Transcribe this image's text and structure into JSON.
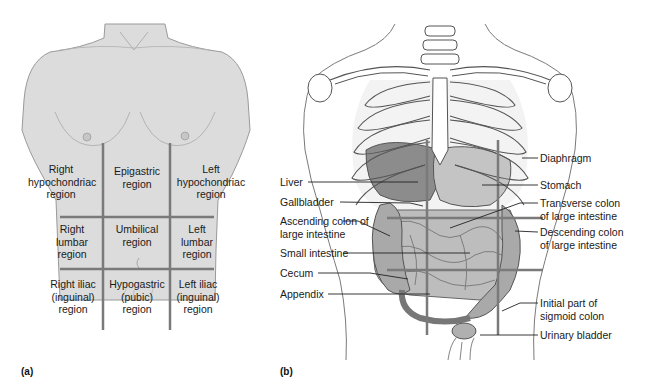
{
  "figure": {
    "panel_a": {
      "letter": "(a)",
      "regions": [
        {
          "id": "right-hypochondriac",
          "label": "Right\nhypochondriac\nregion"
        },
        {
          "id": "epigastric",
          "label": "Epigastric\nregion"
        },
        {
          "id": "left-hypochondriac",
          "label": "Left\nhypochondriac\nregion"
        },
        {
          "id": "right-lumbar",
          "label": "Right\nlumbar\nregion"
        },
        {
          "id": "umbilical",
          "label": "Umbilical\nregion"
        },
        {
          "id": "left-lumbar",
          "label": "Left\nlumbar\nregion"
        },
        {
          "id": "right-iliac",
          "label": "Right iliac\n(inguinal)\nregion"
        },
        {
          "id": "hypogastric",
          "label": "Hypogastric\n(pubic)\nregion"
        },
        {
          "id": "left-iliac",
          "label": "Left iliac\n(inguinal)\nregion"
        }
      ]
    },
    "panel_b": {
      "letter": "(b)",
      "left_labels": [
        {
          "id": "liver",
          "label": "Liver"
        },
        {
          "id": "gallbladder",
          "label": "Gallbladder"
        },
        {
          "id": "ascending-colon",
          "label": "Ascending colon of\nlarge intestine"
        },
        {
          "id": "small-intestine",
          "label": "Small intestine"
        },
        {
          "id": "cecum",
          "label": "Cecum"
        },
        {
          "id": "appendix",
          "label": "Appendix"
        }
      ],
      "right_labels": [
        {
          "id": "diaphragm",
          "label": "Diaphragm"
        },
        {
          "id": "stomach",
          "label": "Stomach"
        },
        {
          "id": "transverse-colon",
          "label": "Transverse colon\nof large intestine"
        },
        {
          "id": "descending-colon",
          "label": "Descending colon\nof large intestine"
        },
        {
          "id": "sigmoid-colon",
          "label": "Initial part of\nsigmoid colon"
        },
        {
          "id": "urinary-bladder",
          "label": "Urinary bladder"
        }
      ]
    },
    "colors": {
      "skin": "#dcdcdc",
      "outline": "#9a9a9a",
      "grid_line": "#7a7a7a",
      "organ": "#b8b8b8",
      "organ_dark": "#8c8c8c",
      "leader": "#222222"
    }
  }
}
